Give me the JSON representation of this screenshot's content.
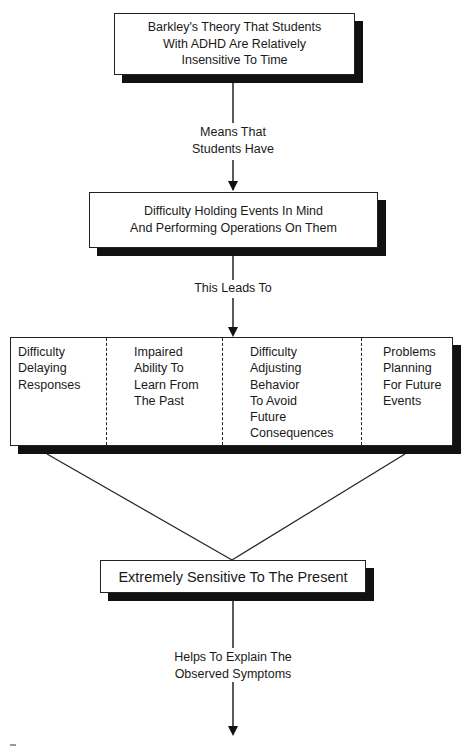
{
  "diagram": {
    "nodes": {
      "theory": {
        "lines": [
          "Barkley's Theory That Students",
          "With ADHD Are Relatively",
          "Insensitive To Time"
        ]
      },
      "difficulty_holding": {
        "lines": [
          "Difficulty Holding Events In Mind",
          "And Performing Operations On Them"
        ]
      },
      "consequences": {
        "cells": [
          {
            "lines": [
              "Difficulty",
              "Delaying",
              "Responses"
            ]
          },
          {
            "lines": [
              "Impaired",
              "Ability To",
              "Learn From",
              "The Past"
            ]
          },
          {
            "lines": [
              "Difficulty",
              "Adjusting",
              "Behavior",
              "To Avoid",
              "Future",
              "Consequences"
            ]
          },
          {
            "lines": [
              "Problems",
              "Planning",
              "For Future",
              "Events"
            ]
          }
        ]
      },
      "present": {
        "text": "Extremely Sensitive To The Present"
      }
    },
    "edges": {
      "theory_to_difficulty": {
        "lines": [
          "Means That",
          "Students Have"
        ]
      },
      "difficulty_to_consequences": {
        "text": "This Leads To"
      },
      "present_to_symptoms": {
        "lines": [
          "Helps To Explain The",
          "Observed Symptoms"
        ]
      }
    }
  },
  "colors": {
    "stroke": "#222222",
    "shadow": "#111111",
    "background": "#ffffff"
  }
}
